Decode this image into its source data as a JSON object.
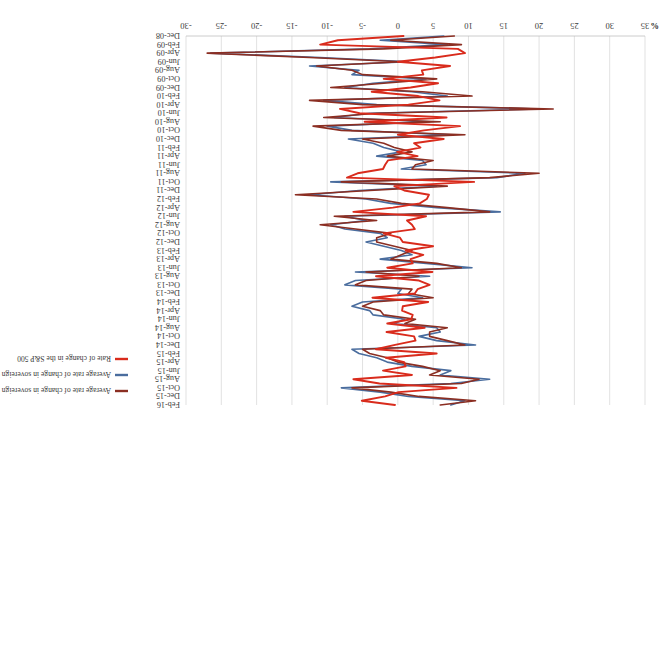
{
  "chart_data": {
    "type": "line",
    "title": "",
    "subtitle": "",
    "xlabel": "",
    "ylabel": "%",
    "axis_unit": "%",
    "ylim": [
      -30,
      35
    ],
    "yticks": [
      35,
      30,
      25,
      20,
      15,
      10,
      5,
      0,
      -5,
      -10,
      -15,
      -20,
      -25,
      -30
    ],
    "ytick_labels": [
      "35",
      "30",
      "25",
      "20",
      "15",
      "10",
      "5",
      "0",
      "-5",
      "-10",
      "-15",
      "-20",
      "-25",
      "-30"
    ],
    "value_axis_reversed": true,
    "grid": true,
    "legend_position": "right",
    "orientation": "rotated-180",
    "category_tick_labels": [
      "Dec-08",
      "Feb-09",
      "Apr-09",
      "Jun-09",
      "Aug-09",
      "Oct-09",
      "Dec-09",
      "Feb-10",
      "Apr-10",
      "Jun-10",
      "Aug-10",
      "Oct-10",
      "Dec-10",
      "Feb-11",
      "Apr-11",
      "Jun-11",
      "Aug-11",
      "Oct-11",
      "Dec-11",
      "Feb-12",
      "Apr-12",
      "Jun-12",
      "Aug-12",
      "Oct-12",
      "Dec-12",
      "Feb-13",
      "Apr-13",
      "Jun-13",
      "Aug-13",
      "Oct-13",
      "Dec-13",
      "Feb-14",
      "Apr-14",
      "Jun-14",
      "Aug-14",
      "Oct-14",
      "Dec-14",
      "Feb-15",
      "Apr-15",
      "Jun-15",
      "Aug-15",
      "Oct-15",
      "Dec-15",
      "Feb-16"
    ],
    "x": [
      "Dec-08",
      "Jan-09",
      "Feb-09",
      "Mar-09",
      "Apr-09",
      "May-09",
      "Jun-09",
      "Jul-09",
      "Aug-09",
      "Sep-09",
      "Oct-09",
      "Nov-09",
      "Dec-09",
      "Jan-10",
      "Feb-10",
      "Mar-10",
      "Apr-10",
      "May-10",
      "Jun-10",
      "Jul-10",
      "Aug-10",
      "Sep-10",
      "Oct-10",
      "Nov-10",
      "Dec-10",
      "Jan-11",
      "Feb-11",
      "Mar-11",
      "Apr-11",
      "May-11",
      "Jun-11",
      "Jul-11",
      "Aug-11",
      "Sep-11",
      "Oct-11",
      "Nov-11",
      "Dec-11",
      "Jan-12",
      "Feb-12",
      "Mar-12",
      "Apr-12",
      "May-12",
      "Jun-12",
      "Jul-12",
      "Aug-12",
      "Sep-12",
      "Oct-12",
      "Nov-12",
      "Dec-12",
      "Jan-13",
      "Feb-13",
      "Mar-13",
      "Apr-13",
      "May-13",
      "Jun-13",
      "Jul-13",
      "Aug-13",
      "Sep-13",
      "Oct-13",
      "Nov-13",
      "Dec-13",
      "Jan-14",
      "Feb-14",
      "Mar-14",
      "Apr-14",
      "May-14",
      "Jun-14",
      "Jul-14",
      "Aug-14",
      "Sep-14",
      "Oct-14",
      "Nov-14",
      "Dec-14",
      "Jan-15",
      "Feb-15",
      "Mar-15",
      "Apr-15",
      "May-15",
      "Jun-15",
      "Jul-15",
      "Aug-15",
      "Sep-15",
      "Oct-15",
      "Nov-15",
      "Dec-15",
      "Jan-16",
      "Feb-16"
    ],
    "series": [
      {
        "name": "Average rate of change in sovereign CDS spreads in emerging economies",
        "color": "#4A6D9E",
        "values": [
          6.5,
          -2.5,
          7.0,
          -4.0,
          -26.5,
          -11.0,
          1.5,
          -12.5,
          -5.5,
          -6.5,
          4.0,
          -3.5,
          -7.5,
          2.0,
          7.0,
          -10.5,
          -3.0,
          20.0,
          -4.0,
          -9.0,
          4.5,
          -10.0,
          -6.5,
          7.5,
          -7.0,
          -3.5,
          -2.0,
          0.5,
          -3.0,
          3.5,
          4.0,
          0.5,
          18.0,
          14.0,
          -9.5,
          5.5,
          -5.5,
          -12.5,
          -4.5,
          -1.0,
          5.5,
          14.5,
          -7.5,
          -4.5,
          -9.5,
          -7.5,
          -2.5,
          -1.5,
          -4.5,
          -2.0,
          0.5,
          2.0,
          -2.5,
          4.0,
          10.5,
          -6.0,
          4.5,
          -6.0,
          -7.5,
          0.5,
          0.0,
          3.5,
          -5.0,
          -6.5,
          -4.0,
          -3.5,
          1.0,
          -0.5,
          5.5,
          6.0,
          3.0,
          5.5,
          11.0,
          -6.5,
          -5.5,
          -3.0,
          -1.5,
          2.0,
          7.5,
          6.0,
          13.0,
          7.5,
          -8.0,
          -2.5,
          1.5,
          9.5,
          7.5
        ]
      },
      {
        "name": "Average rate of change in sovereign CDS spreads in advanced economies",
        "color": "#8B2E22",
        "values": [
          8.0,
          -1.0,
          9.0,
          -2.0,
          -27.0,
          -12.5,
          0.5,
          -11.5,
          -6.5,
          -5.0,
          5.5,
          -2.0,
          -9.5,
          3.5,
          10.5,
          -12.5,
          -5.0,
          22.0,
          -3.0,
          -10.5,
          6.0,
          -12.0,
          -8.0,
          9.5,
          -5.0,
          -2.0,
          -0.5,
          2.0,
          -1.5,
          5.0,
          2.5,
          2.0,
          20.0,
          13.0,
          -8.0,
          7.0,
          -4.0,
          -14.5,
          -3.0,
          0.5,
          7.0,
          13.0,
          -9.0,
          -3.0,
          -11.0,
          -6.0,
          -1.0,
          -3.0,
          -3.0,
          -0.5,
          2.0,
          0.5,
          -1.0,
          5.5,
          9.0,
          -4.5,
          3.0,
          -4.5,
          -6.0,
          2.0,
          1.5,
          5.0,
          -3.5,
          -5.0,
          -2.5,
          -2.0,
          2.5,
          1.0,
          7.0,
          4.5,
          4.5,
          7.0,
          9.5,
          -5.0,
          -4.0,
          -1.5,
          0.0,
          3.5,
          6.0,
          4.5,
          11.5,
          9.0,
          -6.5,
          -1.0,
          3.0,
          11.0,
          6.0
        ]
      },
      {
        "name": "Rate of change in the S&P 500",
        "color": "#D92B1C",
        "values": [
          0.8,
          -8.5,
          -11.0,
          8.5,
          9.5,
          5.3,
          0.0,
          7.4,
          3.4,
          3.6,
          -2.0,
          5.7,
          1.8,
          -3.7,
          2.9,
          5.9,
          1.5,
          -8.2,
          -5.4,
          6.9,
          -4.7,
          8.8,
          3.7,
          0.0,
          6.5,
          2.3,
          3.2,
          -0.1,
          2.8,
          -1.4,
          -1.8,
          -2.1,
          -5.7,
          -7.2,
          10.8,
          -0.5,
          0.9,
          4.4,
          4.1,
          3.1,
          -0.7,
          -6.3,
          4.0,
          1.3,
          2.0,
          2.4,
          -2.0,
          0.3,
          0.7,
          5.0,
          1.1,
          3.6,
          1.8,
          2.1,
          -1.5,
          4.9,
          -3.1,
          3.0,
          4.5,
          2.8,
          2.4,
          -3.6,
          4.3,
          0.7,
          0.6,
          2.1,
          1.9,
          -1.5,
          3.8,
          -1.6,
          2.3,
          2.5,
          -0.4,
          -3.1,
          5.5,
          -1.7,
          0.9,
          1.1,
          -2.1,
          2.0,
          -6.3,
          -2.6,
          8.3,
          0.1,
          -1.8,
          -5.1,
          -0.4
        ]
      }
    ]
  },
  "legend": {
    "items": [
      {
        "label": "Average rate of change in sovereign CDS spreads in advanced economies",
        "color": "#8B2E22"
      },
      {
        "label": "Average rate of change in sovereign CDS spreads in emerging economies",
        "color": "#4A6D9E"
      },
      {
        "label": "Rate of change in the S&P 500",
        "color": "#D92B1C"
      }
    ]
  }
}
